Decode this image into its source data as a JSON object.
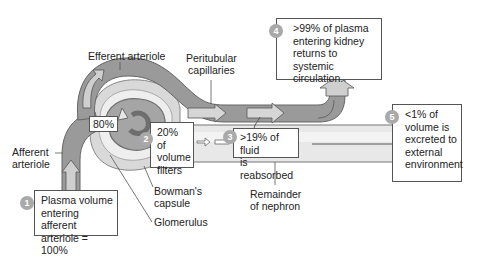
{
  "labels": {
    "efferent_arteriole": "Efferent arteriole",
    "peritubular_capillaries": [
      "Peritubular",
      "capillaries"
    ],
    "afferent_arteriole": [
      "Afferent",
      "arteriole"
    ],
    "bowmans_capsule": [
      "Bowman's",
      "capsule"
    ],
    "glomerulus": "Glomerulus",
    "remainder_of_nephron": [
      "Remainder",
      "of nephron"
    ],
    "eighty_percent": "80%"
  },
  "steps": [
    {
      "number": "1",
      "text": [
        "Plasma volume",
        "entering afferent",
        "arteriole = 100%"
      ]
    },
    {
      "number": "2",
      "text": [
        "20% of",
        "volume",
        "filters"
      ]
    },
    {
      "number": "3",
      "text": [
        ">19% of fluid",
        "is reabsorbed"
      ]
    },
    {
      "number": "4",
      "text": [
        ">99% of plasma",
        "entering kidney",
        "returns to systemic",
        "circulation."
      ]
    },
    {
      "number": "5",
      "text": [
        "<1% of",
        "volume is",
        "excreted to",
        "external",
        "environment"
      ]
    }
  ],
  "colors": {
    "vessel": "#9a9a9a",
    "vessel_dark": "#7d7d7d",
    "capsule": "#d8d8d8",
    "tubule": "#e6e6e6",
    "badge": "#a9a9a9",
    "box_border": "#555555"
  }
}
